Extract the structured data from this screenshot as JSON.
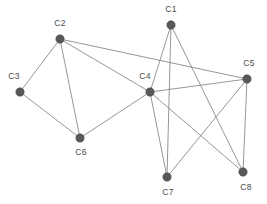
{
  "figure": {
    "width": 267,
    "height": 204,
    "background_color": "#ffffff"
  },
  "style": {
    "node_fill": "#585858",
    "node_stroke": "#3f3f3f",
    "node_radius": 4.2,
    "edge_color": "#8a8a8a",
    "edge_width": 0.9,
    "label_color": "#4a4a4a",
    "label_font_size": 8.6
  },
  "chart_data": {
    "type": "scatter",
    "title": "",
    "xlabel": "",
    "ylabel": "",
    "grid": false,
    "legend": "none",
    "graph_kind": "undirected-node-link",
    "node_count": 8,
    "edge_count": 14,
    "nodes": [
      {
        "id": "C1",
        "label": "C1",
        "x": 171,
        "y": 25,
        "label_x": 171,
        "label_y": 12,
        "label_anchor": "middle",
        "degree": 3
      },
      {
        "id": "C2",
        "label": "C2",
        "x": 60,
        "y": 39,
        "label_x": 60,
        "label_y": 26,
        "label_anchor": "middle",
        "degree": 4
      },
      {
        "id": "C3",
        "label": "C3",
        "x": 20,
        "y": 92,
        "label_x": 14,
        "label_y": 79,
        "label_anchor": "middle",
        "degree": 2
      },
      {
        "id": "C4",
        "label": "C4",
        "x": 150,
        "y": 92,
        "label_x": 145,
        "label_y": 79,
        "label_anchor": "middle",
        "degree": 6
      },
      {
        "id": "C5",
        "label": "C5",
        "x": 247,
        "y": 79,
        "label_x": 249,
        "label_y": 66,
        "label_anchor": "middle",
        "degree": 4
      },
      {
        "id": "C6",
        "label": "C6",
        "x": 80,
        "y": 138,
        "label_x": 81,
        "label_y": 155,
        "label_anchor": "middle",
        "degree": 3
      },
      {
        "id": "C7",
        "label": "C7",
        "x": 167,
        "y": 177,
        "label_x": 168,
        "label_y": 195,
        "label_anchor": "middle",
        "degree": 3
      },
      {
        "id": "C8",
        "label": "C8",
        "x": 243,
        "y": 172,
        "label_x": 246,
        "label_y": 190,
        "label_anchor": "middle",
        "degree": 3
      }
    ],
    "edges": [
      {
        "source": "C1",
        "target": "C4"
      },
      {
        "source": "C1",
        "target": "C7"
      },
      {
        "source": "C1",
        "target": "C8"
      },
      {
        "source": "C2",
        "target": "C3"
      },
      {
        "source": "C2",
        "target": "C4"
      },
      {
        "source": "C2",
        "target": "C5"
      },
      {
        "source": "C2",
        "target": "C6"
      },
      {
        "source": "C3",
        "target": "C6"
      },
      {
        "source": "C4",
        "target": "C5"
      },
      {
        "source": "C4",
        "target": "C6"
      },
      {
        "source": "C4",
        "target": "C7"
      },
      {
        "source": "C4",
        "target": "C8"
      },
      {
        "source": "C5",
        "target": "C7"
      },
      {
        "source": "C5",
        "target": "C8"
      }
    ]
  }
}
